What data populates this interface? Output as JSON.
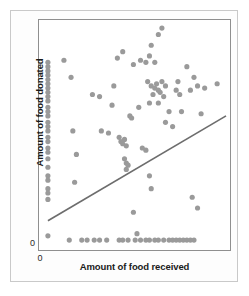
{
  "figure": {
    "axis_color": "#8f8f8f",
    "dot_color": "#9a9a9a",
    "line_color": "#6d6d6d",
    "card_background": "#fdfdfd"
  },
  "axes": {
    "x_label": "Amount of food received",
    "y_label": "Amount of food donated",
    "x_tick_zero": "0",
    "y_tick_zero": "0"
  },
  "chart_data": {
    "type": "scatter",
    "title": "",
    "xlabel": "Amount of food received",
    "ylabel": "Amount of food donated",
    "xlim": [
      0,
      100
    ],
    "ylim": [
      0,
      100
    ],
    "grid": false,
    "legend": null,
    "xticks": [
      0
    ],
    "yticks": [
      0
    ],
    "xticklabels": [
      "0"
    ],
    "yticklabels": [
      "0"
    ],
    "points": [
      [
        0,
        83
      ],
      [
        0,
        81
      ],
      [
        0,
        79
      ],
      [
        0,
        77
      ],
      [
        0,
        75
      ],
      [
        0,
        73
      ],
      [
        0,
        71
      ],
      [
        0,
        69
      ],
      [
        0,
        67
      ],
      [
        0,
        65
      ],
      [
        0,
        62
      ],
      [
        0,
        60
      ],
      [
        0,
        58
      ],
      [
        0,
        55
      ],
      [
        0,
        53
      ],
      [
        0,
        51
      ],
      [
        0,
        48
      ],
      [
        0,
        46
      ],
      [
        0,
        43
      ],
      [
        0,
        41
      ],
      [
        0,
        38
      ],
      [
        0,
        34
      ],
      [
        0,
        30
      ],
      [
        0,
        28
      ],
      [
        0,
        24
      ],
      [
        0,
        22
      ],
      [
        0,
        19
      ],
      [
        0,
        2
      ],
      [
        9,
        84
      ],
      [
        13,
        76
      ],
      [
        14,
        51
      ],
      [
        16,
        40
      ],
      [
        15,
        27
      ],
      [
        25,
        68
      ],
      [
        29,
        67
      ],
      [
        30,
        51
      ],
      [
        34,
        50
      ],
      [
        37,
        72
      ],
      [
        36,
        63
      ],
      [
        40,
        48
      ],
      [
        41,
        46
      ],
      [
        42,
        45
      ],
      [
        43,
        47
      ],
      [
        44,
        44
      ],
      [
        43,
        38
      ],
      [
        44,
        36
      ],
      [
        45,
        35
      ],
      [
        44,
        33
      ],
      [
        39,
        85
      ],
      [
        42,
        88
      ],
      [
        46,
        58
      ],
      [
        47,
        57
      ],
      [
        48,
        82
      ],
      [
        52,
        84
      ],
      [
        51,
        62
      ],
      [
        55,
        83
      ],
      [
        57,
        86
      ],
      [
        60,
        83
      ],
      [
        58,
        91
      ],
      [
        62,
        96
      ],
      [
        64,
        99
      ],
      [
        56,
        74
      ],
      [
        58,
        72
      ],
      [
        60,
        71
      ],
      [
        61,
        73
      ],
      [
        62,
        70
      ],
      [
        63,
        69
      ],
      [
        59,
        68
      ],
      [
        64,
        74
      ],
      [
        65,
        67
      ],
      [
        66,
        72
      ],
      [
        57,
        64
      ],
      [
        62,
        64
      ],
      [
        68,
        60
      ],
      [
        66,
        55
      ],
      [
        53,
        43
      ],
      [
        55,
        42
      ],
      [
        57,
        30
      ],
      [
        58,
        24
      ],
      [
        70,
        53
      ],
      [
        72,
        70
      ],
      [
        73,
        74
      ],
      [
        74,
        68
      ],
      [
        75,
        60
      ],
      [
        78,
        81
      ],
      [
        80,
        70
      ],
      [
        82,
        76
      ],
      [
        84,
        72
      ],
      [
        88,
        71
      ],
      [
        95,
        73
      ],
      [
        86,
        59
      ],
      [
        81,
        20
      ],
      [
        84,
        15
      ],
      [
        48,
        13
      ],
      [
        50,
        3
      ],
      [
        12,
        0
      ],
      [
        19,
        0
      ],
      [
        22,
        0
      ],
      [
        26,
        0
      ],
      [
        29,
        0
      ],
      [
        33,
        0
      ],
      [
        40,
        0
      ],
      [
        42,
        0
      ],
      [
        45,
        0
      ],
      [
        49,
        0
      ],
      [
        52,
        0
      ],
      [
        55,
        0
      ],
      [
        57,
        0
      ],
      [
        60,
        0
      ],
      [
        62,
        0
      ],
      [
        65,
        0
      ],
      [
        68,
        0
      ],
      [
        70,
        0
      ],
      [
        72,
        0
      ],
      [
        74,
        0
      ],
      [
        76,
        0
      ],
      [
        78,
        0
      ],
      [
        80,
        0
      ],
      [
        82,
        0
      ]
    ],
    "trendline": {
      "x": [
        0,
        100
      ],
      "y": [
        9,
        58
      ]
    }
  }
}
